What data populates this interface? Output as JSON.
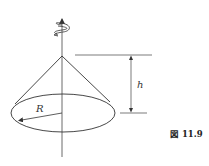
{
  "figure": {
    "caption": "図 11.9",
    "labels": {
      "radius": "R",
      "height": "h"
    },
    "icons": [
      "rotation-arrow-icon",
      "axis-arrow-icon"
    ],
    "colors": {
      "stroke": "#333333",
      "background": "#ffffff"
    }
  }
}
